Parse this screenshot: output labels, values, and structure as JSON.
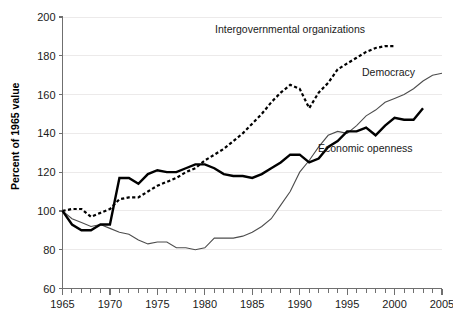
{
  "chart_data": {
    "type": "line",
    "title": "",
    "xlabel": "",
    "ylabel": "Percent of 1965 value",
    "xlim": [
      1965,
      2005
    ],
    "ylim": [
      60,
      200
    ],
    "yticks": [
      60,
      80,
      100,
      120,
      140,
      160,
      180,
      200
    ],
    "xticks": [
      1965,
      1970,
      1975,
      1980,
      1985,
      1990,
      1995,
      2000,
      2005
    ],
    "x_minor_tick_interval": 1,
    "grid": "horizontal",
    "legend_position": "inline-annotations",
    "series": [
      {
        "name": "Intergovernmental organizations",
        "style": "dotted",
        "color": "#000000",
        "label_x": 1988,
        "label_y": 192,
        "x": [
          1965,
          1966,
          1967,
          1968,
          1969,
          1970,
          1971,
          1972,
          1973,
          1974,
          1975,
          1976,
          1977,
          1978,
          1979,
          1980,
          1981,
          1982,
          1983,
          1984,
          1985,
          1986,
          1987,
          1988,
          1989,
          1990,
          1991,
          1992,
          1993,
          1994,
          1995,
          1996,
          1997,
          1998,
          1999,
          2000
        ],
        "values": [
          100,
          101,
          101,
          97,
          99,
          101,
          106,
          107,
          107,
          110,
          113,
          115,
          117,
          120,
          122,
          126,
          129,
          132,
          136,
          140,
          145,
          150,
          156,
          161,
          165,
          163,
          153,
          161,
          166,
          173,
          176,
          179,
          182,
          184,
          185,
          185
        ]
      },
      {
        "name": "Democracy",
        "style": "thin-solid",
        "color": "#4d4d4d",
        "label_x": 1997,
        "label_y": 168,
        "x": [
          1965,
          1966,
          1967,
          1968,
          1969,
          1970,
          1971,
          1972,
          1973,
          1974,
          1975,
          1976,
          1977,
          1978,
          1979,
          1980,
          1981,
          1982,
          1983,
          1984,
          1985,
          1986,
          1987,
          1988,
          1989,
          1990,
          1991,
          1992,
          1993,
          1994,
          1995,
          1996,
          1997,
          1998,
          1999,
          2000,
          2001,
          2002,
          2003,
          2004,
          2005
        ],
        "values": [
          100,
          96,
          94,
          92,
          93,
          91,
          89,
          88,
          85,
          83,
          84,
          84,
          81,
          81,
          80,
          81,
          86,
          86,
          86,
          87,
          89,
          92,
          96,
          103,
          110,
          120,
          126,
          133,
          139,
          141,
          140,
          144,
          149,
          152,
          156,
          158,
          160,
          163,
          167,
          170,
          171
        ]
      },
      {
        "name": "Economic openness",
        "style": "thick-solid",
        "color": "#000000",
        "label_x": 1996,
        "label_y": 140,
        "x": [
          1965,
          1966,
          1967,
          1968,
          1969,
          1970,
          1971,
          1972,
          1973,
          1974,
          1975,
          1976,
          1977,
          1978,
          1979,
          1980,
          1981,
          1982,
          1983,
          1984,
          1985,
          1986,
          1987,
          1988,
          1989,
          1990,
          1991,
          1992,
          1993,
          1994,
          1995,
          1996,
          1997,
          1998,
          1999,
          2000,
          2001,
          2002,
          2003
        ],
        "values": [
          100,
          93,
          90,
          90,
          93,
          93,
          117,
          117,
          114,
          119,
          121,
          120,
          120,
          122,
          124,
          124,
          122,
          119,
          118,
          118,
          117,
          119,
          122,
          125,
          129,
          129,
          125,
          127,
          133,
          136,
          141,
          141,
          143,
          139,
          144,
          148,
          147,
          147,
          153
        ]
      }
    ]
  },
  "axis": {
    "y_title": "Percent of 1965 value",
    "y_tick_labels": [
      "200",
      "180",
      "160",
      "140",
      "120",
      "100",
      "80",
      "60"
    ],
    "x_tick_labels": [
      "1965",
      "1970",
      "1975",
      "1980",
      "1985",
      "1990",
      "1995",
      "2000",
      "2005"
    ]
  },
  "annotations": {
    "igo": "Intergovernmental organizations",
    "democracy": "Democracy",
    "openness": "Economic openness"
  }
}
